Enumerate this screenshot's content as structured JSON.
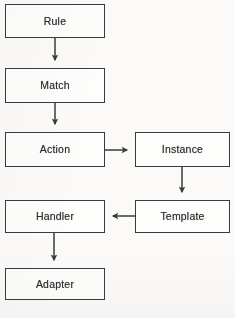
{
  "diagram": {
    "type": "flowchart",
    "background_color": "#fbfaf8",
    "stroke_color": "#3b3b3b",
    "text_color": "#2b2b2b",
    "nodes": [
      {
        "id": "rule",
        "label": "Rule",
        "x": 5,
        "y": 4,
        "w": 100,
        "h": 34
      },
      {
        "id": "match",
        "label": "Match",
        "x": 5,
        "y": 68,
        "w": 100,
        "h": 35
      },
      {
        "id": "action",
        "label": "Action",
        "x": 5,
        "y": 132,
        "w": 100,
        "h": 35
      },
      {
        "id": "instance",
        "label": "Instance",
        "x": 135,
        "y": 132,
        "w": 95,
        "h": 35
      },
      {
        "id": "template",
        "label": "Template",
        "x": 135,
        "y": 200,
        "w": 95,
        "h": 33
      },
      {
        "id": "handler",
        "label": "Handler",
        "x": 5,
        "y": 200,
        "w": 100,
        "h": 33
      },
      {
        "id": "adapter",
        "label": "Adapter",
        "x": 5,
        "y": 268,
        "w": 100,
        "h": 32
      }
    ],
    "edges": [
      {
        "id": "rule-to-match",
        "from": "rule",
        "to": "match",
        "direction": "down",
        "arrowhead": true
      },
      {
        "id": "match-to-action",
        "from": "match",
        "to": "action",
        "direction": "down",
        "arrowhead": true
      },
      {
        "id": "action-to-instance",
        "from": "action",
        "to": "instance",
        "direction": "right",
        "arrowhead": true
      },
      {
        "id": "instance-to-template",
        "from": "instance",
        "to": "template",
        "direction": "down",
        "arrowhead": true
      },
      {
        "id": "template-to-handler",
        "from": "template",
        "to": "handler",
        "direction": "left",
        "arrowhead": true
      },
      {
        "id": "handler-to-adapter",
        "from": "handler",
        "to": "adapter",
        "direction": "down",
        "arrowhead": true
      }
    ]
  }
}
